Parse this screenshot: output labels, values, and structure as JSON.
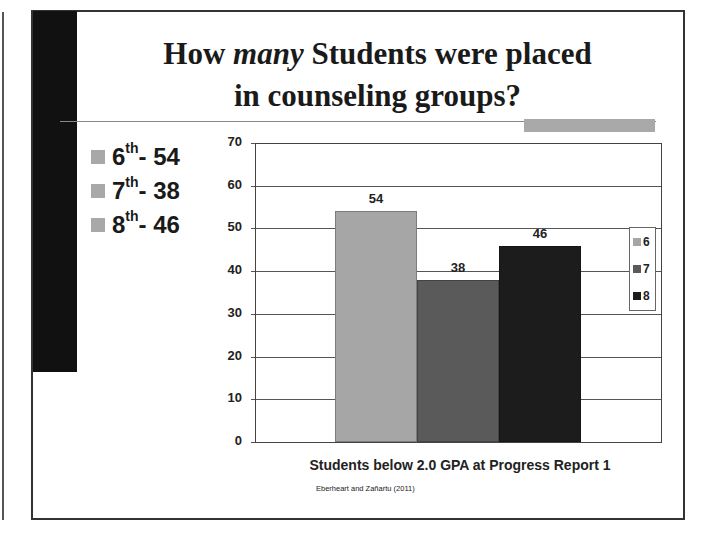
{
  "slide": {
    "title_part1": "How ",
    "title_emphasis": "many",
    "title_part2": " Students were placed",
    "title_line2": "in counseling groups?",
    "bullets": [
      {
        "grade": "6",
        "suffix": "th",
        "text": " - 54"
      },
      {
        "grade": "7",
        "suffix": "th",
        "text": " - 38"
      },
      {
        "grade": "8",
        "suffix": "th",
        "text": " - 46"
      }
    ],
    "citation": "Eberheart and Zañartu (2011)"
  },
  "chart_data": {
    "type": "bar",
    "title": "",
    "xlabel": "Students below 2.0 GPA at Progress Report 1",
    "ylabel": "",
    "categories": [
      "Students below 2.0 GPA at Progress Report 1"
    ],
    "series": [
      {
        "name": "6",
        "values": [
          54
        ],
        "color": "#a6a6a6"
      },
      {
        "name": "7",
        "values": [
          38
        ],
        "color": "#5a5a5a"
      },
      {
        "name": "8",
        "values": [
          46
        ],
        "color": "#1c1c1c"
      }
    ],
    "ylim": [
      0,
      70
    ],
    "yticks": [
      0,
      10,
      20,
      30,
      40,
      50,
      60,
      70
    ],
    "ytick_labels": [
      "0",
      "10",
      "20",
      "30",
      "40",
      "50",
      "60",
      "70"
    ],
    "data_labels": [
      "54",
      "38",
      "46"
    ],
    "grid": true,
    "legend": {
      "position": "right",
      "entries": [
        "6",
        "7",
        "8"
      ]
    }
  }
}
